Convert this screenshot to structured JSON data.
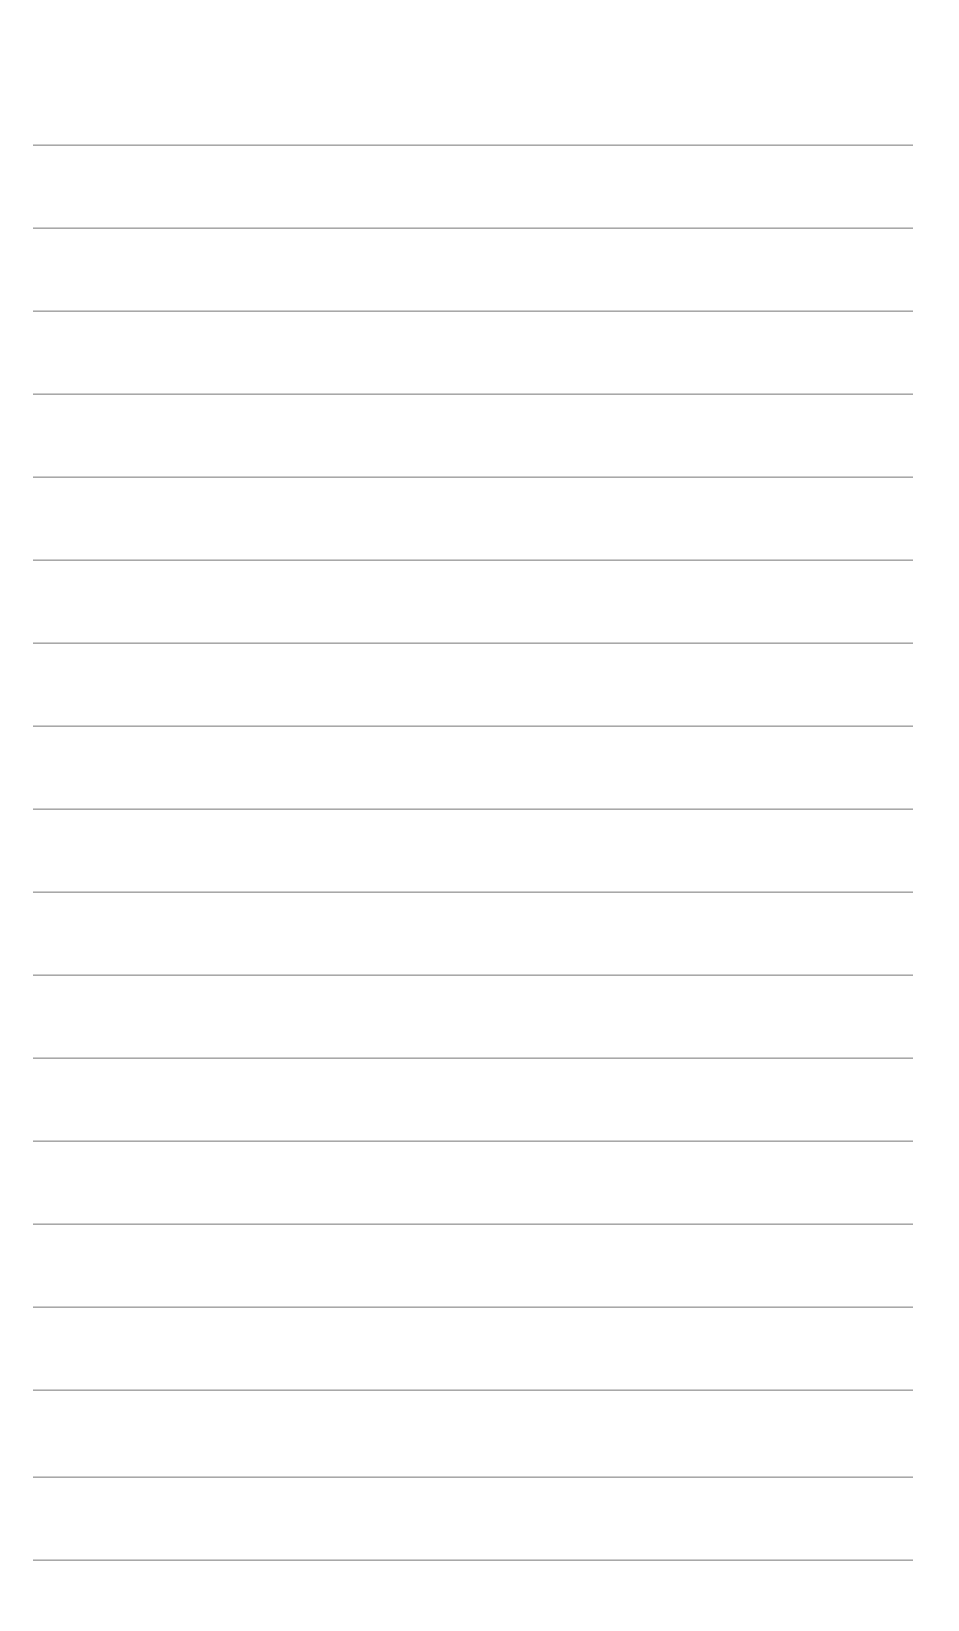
{
  "page": {
    "type": "lined-paper",
    "background_color": "#ffffff",
    "line_color": "#9a9a9a",
    "line_count": 18,
    "line_left": 33,
    "line_width": 880,
    "line_positions_y": [
      145,
      228,
      311,
      394,
      477,
      560,
      643,
      726,
      809,
      892,
      975,
      1058,
      1141,
      1224,
      1307,
      1390,
      1477,
      1560
    ],
    "text": ""
  }
}
